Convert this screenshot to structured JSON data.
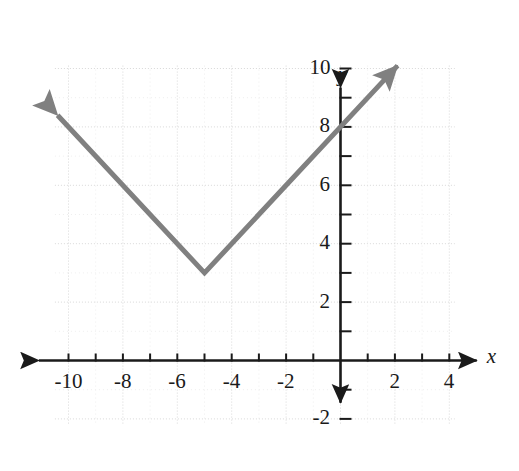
{
  "figure": {
    "name": "absolute-value-function-graph",
    "width": 519,
    "height": 471,
    "background_color": "#ffffff"
  },
  "colors": {
    "curve": "#808080",
    "axis": "#1a1a1a",
    "grid_major": "#d8d8d8",
    "grid_minor": "#eeeeee",
    "label_text": "#1a1a1a",
    "background": "#ffffff"
  },
  "axes": {
    "x_axis_label": "x",
    "y_axis_label": "y",
    "x_tick_labels": [
      "-10",
      "-8",
      "-6",
      "-4",
      "-2",
      "2",
      "4"
    ],
    "y_tick_labels": [
      "10",
      "8",
      "6",
      "4",
      "2",
      "-2"
    ],
    "x_range": [
      -10.9,
      5.4
    ],
    "y_range": [
      -2.9,
      10.9
    ],
    "x_tick_step": 1,
    "y_tick_step": 1,
    "x_label_step": 2,
    "y_label_step": 2,
    "grid": true,
    "grid_x_extent": [
      -10.5,
      4.2
    ],
    "grid_y_extent": [
      -2.2,
      10.1
    ],
    "arrowheads": {
      "x_positive": true,
      "x_negative": true,
      "y_positive": true,
      "y_negative": true
    }
  },
  "chart_data": {
    "type": "line",
    "title": "",
    "subtitle": "",
    "xlabel": "x",
    "ylabel": "y",
    "xlim": [
      -10.9,
      5.4
    ],
    "ylim": [
      -2.9,
      10.9
    ],
    "grid": true,
    "legend": null,
    "legend_position": "none",
    "function": "y = |x + 5| + 3",
    "vertex": [
      -5,
      3
    ],
    "slopes": [
      -1,
      1
    ],
    "y_intercept": 8,
    "x_tick_values": [
      -10,
      -9,
      -8,
      -7,
      -6,
      -5,
      -4,
      -3,
      -2,
      -1,
      1,
      2,
      3,
      4
    ],
    "x_tick_labels_shown": [
      -10,
      -8,
      -6,
      -4,
      -2,
      2,
      4
    ],
    "y_tick_values": [
      10,
      9,
      8,
      7,
      6,
      5,
      4,
      3,
      2,
      1,
      -1,
      -2
    ],
    "y_tick_labels_shown": [
      10,
      8,
      6,
      4,
      2,
      -2
    ],
    "series": [
      {
        "name": "y = |x + 5| + 3",
        "color": "#808080",
        "line_width": 5,
        "arrow_start": true,
        "arrow_end": true,
        "points": [
          [
            -10.4,
            8.4
          ],
          [
            -5,
            3
          ],
          [
            2.1,
            10.1
          ]
        ],
        "sampled_points": [
          [
            -10,
            8
          ],
          [
            -9,
            7
          ],
          [
            -8,
            6
          ],
          [
            -7,
            5
          ],
          [
            -6,
            4
          ],
          [
            -5,
            3
          ],
          [
            -4,
            4
          ],
          [
            -3,
            5
          ],
          [
            -2,
            6
          ],
          [
            -1,
            7
          ],
          [
            0,
            8
          ],
          [
            1,
            9
          ],
          [
            2,
            10
          ]
        ]
      }
    ],
    "annotations": []
  }
}
